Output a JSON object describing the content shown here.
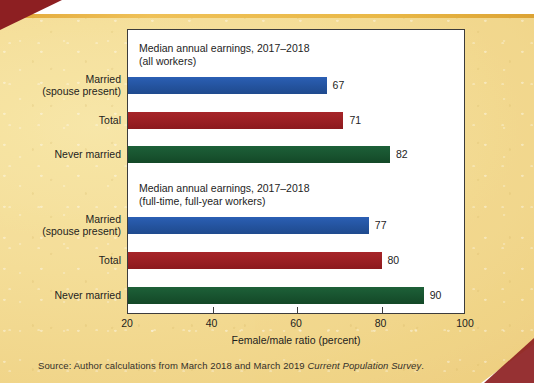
{
  "chart_data": {
    "type": "bar",
    "orientation": "horizontal",
    "title": "",
    "xlabel": "Female/male ratio (percent)",
    "ylabel": "",
    "xlim": [
      20,
      100
    ],
    "xticks": [
      20,
      40,
      60,
      80,
      100
    ],
    "grid": false,
    "legend": "none",
    "panels": [
      {
        "title": "Median annual earnings, 2017–2018\n(all workers)",
        "categories": [
          "Married\n(spouse present)",
          "Total",
          "Never married"
        ],
        "values": [
          67,
          71,
          82
        ],
        "colors": [
          "#24539e",
          "#9a1f23",
          "#18532f"
        ]
      },
      {
        "title": "Median annual earnings, 2017–2018\n(full-time, full-year workers)",
        "categories": [
          "Married\n(spouse present)",
          "Total",
          "Never married"
        ],
        "values": [
          77,
          80,
          90
        ],
        "colors": [
          "#24539e",
          "#9a1f23",
          "#18532f"
        ]
      }
    ]
  },
  "axis": {
    "x_title": "Female/male ratio (percent)",
    "tick_labels": [
      "20",
      "40",
      "60",
      "80",
      "100"
    ]
  },
  "panels": [
    {
      "title_line1": "Median annual earnings, 2017–2018",
      "title_line2": "(all workers)",
      "title": "Median annual earnings, 2017–2018\n(all workers)",
      "bars": [
        {
          "label": "Married\n(spouse present)",
          "label_line1": "Married",
          "label_line2": "(spouse present)",
          "value": 67,
          "value_text": "67",
          "color": "#24539e",
          "color_name": "blue"
        },
        {
          "label": "Total",
          "label_line1": "Total",
          "label_line2": "",
          "value": 71,
          "value_text": "71",
          "color": "#9a1f23",
          "color_name": "red"
        },
        {
          "label": "Never married",
          "label_line1": "Never married",
          "label_line2": "",
          "value": 82,
          "value_text": "82",
          "color": "#18532f",
          "color_name": "green"
        }
      ]
    },
    {
      "title_line1": "Median annual earnings, 2017–2018",
      "title_line2": "(full-time, full-year workers)",
      "title": "Median annual earnings, 2017–2018\n(full-time, full-year workers)",
      "bars": [
        {
          "label": "Married\n(spouse present)",
          "label_line1": "Married",
          "label_line2": "(spouse present)",
          "value": 77,
          "value_text": "77",
          "color": "#24539e",
          "color_name": "blue"
        },
        {
          "label": "Total",
          "label_line1": "Total",
          "label_line2": "",
          "value": 80,
          "value_text": "80",
          "color": "#9a1f23",
          "color_name": "red"
        },
        {
          "label": "Never married",
          "label_line1": "Never married",
          "label_line2": "",
          "value": 90,
          "value_text": "90",
          "color": "#18532f",
          "color_name": "green"
        }
      ]
    }
  ],
  "source": {
    "prefix": "Source: Author calculations from March 2018 and March 2019 ",
    "italic": "Current Population Survey",
    "suffix": "."
  },
  "colors": {
    "card_background": "#f4dd97",
    "card_top_rule": "#e9b846",
    "corner_wedge": "#8d1f22",
    "plot_background": "#ffffff",
    "axis_line": "#3c3c3c",
    "text": "#1d1d1d",
    "bar_blue": "#24539e",
    "bar_red": "#9a1f23",
    "bar_green": "#18532f"
  }
}
